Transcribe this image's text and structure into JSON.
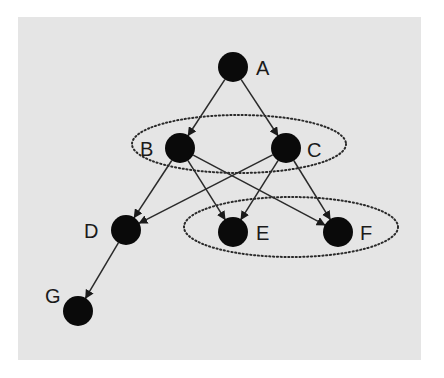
{
  "diagram": {
    "type": "directed-graph",
    "panel": {
      "x": 18,
      "y": 17,
      "width": 403,
      "height": 343,
      "fill": "#e5e5e5"
    },
    "colors": {
      "node": "#0a0a0a",
      "edge": "#2a2a2a",
      "group_outline": "#2a2a2a"
    },
    "node_radius": 15,
    "nodes": [
      {
        "id": "A",
        "label": "A",
        "x": 233,
        "y": 67,
        "label_x": 256,
        "label_y": 75
      },
      {
        "id": "B",
        "label": "B",
        "x": 180,
        "y": 148,
        "label_x": 140,
        "label_y": 156
      },
      {
        "id": "C",
        "label": "C",
        "x": 286,
        "y": 148,
        "label_x": 307,
        "label_y": 157
      },
      {
        "id": "D",
        "label": "D",
        "x": 126,
        "y": 230,
        "label_x": 84,
        "label_y": 238
      },
      {
        "id": "E",
        "label": "E",
        "x": 233,
        "y": 232,
        "label_x": 256,
        "label_y": 240
      },
      {
        "id": "F",
        "label": "F",
        "x": 338,
        "y": 232,
        "label_x": 360,
        "label_y": 240
      },
      {
        "id": "G",
        "label": "G",
        "x": 78,
        "y": 311,
        "label_x": 45,
        "label_y": 303
      }
    ],
    "edges": [
      {
        "from": "A",
        "to": "B"
      },
      {
        "from": "A",
        "to": "C"
      },
      {
        "from": "B",
        "to": "D"
      },
      {
        "from": "B",
        "to": "E"
      },
      {
        "from": "B",
        "to": "F"
      },
      {
        "from": "C",
        "to": "D"
      },
      {
        "from": "C",
        "to": "E"
      },
      {
        "from": "C",
        "to": "F"
      },
      {
        "from": "D",
        "to": "G"
      }
    ],
    "groups": [
      {
        "id": "group-BC",
        "members": [
          "B",
          "C"
        ],
        "cx": 239,
        "cy": 144,
        "rx": 107,
        "ry": 29,
        "style": "dotted"
      },
      {
        "id": "group-EF",
        "members": [
          "E",
          "F"
        ],
        "cx": 291,
        "cy": 227,
        "rx": 107,
        "ry": 30,
        "style": "dotted"
      }
    ]
  }
}
